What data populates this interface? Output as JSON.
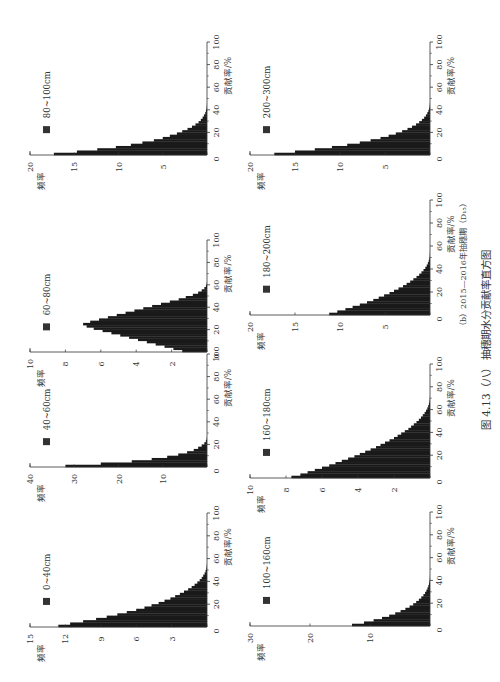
{
  "figure": {
    "subcaption": "（b）2015—2016年抽穗期（D₁₅）",
    "caption": "图 4.13（八） 抽穗期水分贡献率直方图",
    "bar_color": "#1a1a1a",
    "axis_color": "#333333"
  },
  "chart_data": [
    {
      "type": "bar",
      "orientation": "histogram (page rotated 90° CCW)",
      "legend": "80~100cm",
      "xlabel": "贡献率/%",
      "ylabel": "频率",
      "xlim": [
        0,
        100
      ],
      "xticks": [
        20,
        40,
        60,
        80,
        100
      ],
      "ylim": [
        0,
        20
      ],
      "yticks": [
        0,
        5,
        10,
        15,
        20
      ],
      "bin_width": 2,
      "values": [
        17.3,
        14.7,
        12.4,
        10.3,
        8.6,
        7.3,
        6.0,
        5.0,
        4.2,
        3.4,
        2.8,
        2.2,
        1.7,
        1.3,
        0.95,
        0.7,
        0.5,
        0.35,
        0.2,
        0.12,
        0.06,
        0.03,
        0.01
      ]
    },
    {
      "type": "bar",
      "legend": "60~80cm",
      "xlabel": "贡献率/%",
      "ylabel": "频率",
      "xlim": [
        0,
        100
      ],
      "xticks": [
        20,
        40,
        60,
        80,
        100
      ],
      "ylim": [
        0,
        10
      ],
      "yticks": [
        0,
        2,
        4,
        6,
        8,
        10
      ],
      "bin_width": 2,
      "values": [
        1.4,
        1.9,
        2.4,
        2.9,
        3.4,
        3.9,
        4.4,
        4.9,
        5.4,
        5.9,
        6.4,
        6.8,
        7.0,
        6.6,
        6.1,
        5.6,
        5.1,
        4.6,
        4.1,
        3.6,
        3.1,
        2.6,
        2.1,
        1.6,
        1.2,
        0.8,
        0.5,
        0.3,
        0.15,
        0.06,
        0.02
      ]
    },
    {
      "type": "bar",
      "legend": "40~60cm",
      "xlabel": "贡献率/%",
      "ylabel": "频率",
      "xlim": [
        0,
        100
      ],
      "xticks": [
        20,
        40,
        60,
        80,
        100
      ],
      "ylim": [
        0,
        40
      ],
      "yticks": [
        0,
        10,
        20,
        30,
        40
      ],
      "bin_width": 2,
      "values": [
        32.0,
        24.0,
        17.0,
        12.5,
        9.0,
        6.5,
        4.5,
        3.0,
        2.0,
        1.2,
        0.6,
        0.25,
        0.08
      ]
    },
    {
      "type": "bar",
      "legend": "0~40cm",
      "xlabel": "贡献率/%",
      "ylabel": "频率",
      "xlim": [
        0,
        100
      ],
      "xticks": [
        20,
        40,
        60,
        80,
        100
      ],
      "ylim": [
        0,
        15
      ],
      "yticks": [
        0,
        3,
        6,
        9,
        12,
        15
      ],
      "bin_width": 2,
      "values": [
        12.6,
        11.6,
        10.5,
        9.4,
        8.5,
        7.6,
        6.8,
        6.0,
        5.3,
        4.7,
        4.1,
        3.6,
        3.1,
        2.7,
        2.3,
        1.95,
        1.6,
        1.3,
        1.05,
        0.82,
        0.62,
        0.45,
        0.32,
        0.2,
        0.12,
        0.06,
        0.03,
        0.01
      ]
    },
    {
      "type": "bar",
      "legend": "200~300cm",
      "xlabel": "贡献率/%",
      "ylabel": "频率",
      "xlim": [
        0,
        100
      ],
      "xticks": [
        20,
        40,
        60,
        80,
        100
      ],
      "ylim": [
        0,
        20
      ],
      "yticks": [
        0,
        5,
        10,
        15,
        20
      ],
      "bin_width": 2,
      "values": [
        17.3,
        15.0,
        12.8,
        10.9,
        9.2,
        7.8,
        6.6,
        5.5,
        4.6,
        3.8,
        3.1,
        2.5,
        2.0,
        1.55,
        1.2,
        0.9,
        0.65,
        0.45,
        0.3,
        0.18,
        0.1,
        0.05,
        0.02
      ]
    },
    {
      "type": "bar",
      "legend": "180~200cm",
      "xlabel": "贡献率/%",
      "ylabel": "频率",
      "xlim": [
        0,
        100
      ],
      "xticks": [
        20,
        40,
        60,
        80,
        100
      ],
      "ylim": [
        0,
        20
      ],
      "yticks": [
        0,
        5,
        10,
        15,
        20
      ],
      "bin_width": 2,
      "values": [
        11.2,
        10.3,
        9.4,
        8.6,
        7.8,
        7.0,
        6.3,
        5.7,
        5.1,
        4.5,
        4.0,
        3.5,
        3.0,
        2.6,
        2.2,
        1.85,
        1.5,
        1.2,
        0.95,
        0.72,
        0.52,
        0.36,
        0.24,
        0.14,
        0.08,
        0.04,
        0.02,
        0.01,
        0.005,
        0.002
      ]
    },
    {
      "type": "bar",
      "legend": "160~180cm",
      "xlabel": "贡献率/%",
      "ylabel": "频率",
      "xlim": [
        0,
        100
      ],
      "xticks": [
        20,
        40,
        60,
        80,
        100
      ],
      "ylim": [
        0,
        10
      ],
      "yticks": [
        0,
        2,
        4,
        6,
        8,
        10
      ],
      "bin_width": 2,
      "values": [
        7.7,
        7.2,
        6.8,
        6.4,
        6.0,
        5.6,
        5.25,
        4.9,
        4.55,
        4.2,
        3.9,
        3.6,
        3.3,
        3.0,
        2.75,
        2.5,
        2.25,
        2.0,
        1.8,
        1.6,
        1.4,
        1.2,
        1.05,
        0.9,
        0.75,
        0.62,
        0.5,
        0.4,
        0.3,
        0.22,
        0.15,
        0.1,
        0.06,
        0.03,
        0.015,
        0.005
      ]
    },
    {
      "type": "bar",
      "legend": "100~160cm",
      "xlabel": "贡献率/%",
      "ylabel": "频率",
      "xlim": [
        0,
        100
      ],
      "xticks": [
        20,
        40,
        60,
        80,
        100
      ],
      "ylim": [
        0,
        30
      ],
      "yticks": [
        0,
        10,
        20,
        30
      ],
      "bin_width": 2,
      "values": [
        13.0,
        11.0,
        9.4,
        8.0,
        6.8,
        5.8,
        4.9,
        4.1,
        3.4,
        2.8,
        2.3,
        1.85,
        1.45,
        1.1,
        0.82,
        0.6,
        0.42,
        0.28,
        0.17,
        0.1,
        0.05,
        0.02,
        0.01
      ]
    }
  ]
}
